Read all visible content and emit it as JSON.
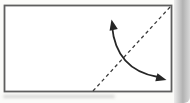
{
  "diagram": {
    "type": "origami-fold-step",
    "colors": {
      "background": "#fbfbf9",
      "paper_fill": "#ffffff",
      "paper_border": "#5e5e5e",
      "crease": "#3c3c3c",
      "arrow": "#262626",
      "page_edge_light": "#ececec",
      "page_edge_dark": "#b2b2b2",
      "page_edge_end": "#d8d8d8"
    },
    "paper": {
      "x": "4.5",
      "y": "5.5",
      "width": "167",
      "height": "86",
      "stroke_width": "1.8"
    },
    "crease_line": {
      "x1": "93",
      "y1": "91",
      "x2": "170.5",
      "y2": "6.5",
      "dash": "3.5 3",
      "stroke_width": "1.3"
    },
    "arrow": {
      "path": "M 112 26 Q 116 70 158 77",
      "stroke_width": "1.8",
      "head_points": "0,0 -4.2,10.5 4.2,10.5",
      "head_up_transform": "translate(111.5,19.5) rotate(-12)",
      "head_right_transform": "translate(166.5,80) rotate(105)"
    }
  }
}
